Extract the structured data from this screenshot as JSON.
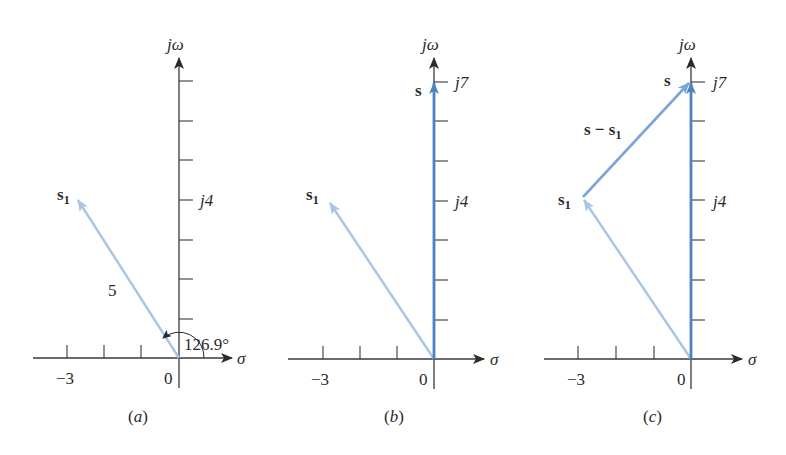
{
  "figure": {
    "panels": [
      {
        "id": "a",
        "caption": "(a)",
        "axis_x_label": "σ",
        "axis_y_label": "jω",
        "tick_label_neg3": "−3",
        "tick_label_origin": "0",
        "tick_label_j4": "j4",
        "vector_s1_label": "s",
        "vector_s1_sub": "1",
        "magnitude_label": "5",
        "angle_label": "126.9°"
      },
      {
        "id": "b",
        "caption": "(b)",
        "axis_x_label": "σ",
        "axis_y_label": "jω",
        "tick_label_neg3": "−3",
        "tick_label_origin": "0",
        "tick_label_j4": "j4",
        "tick_label_j7": "j7",
        "vector_s1_label": "s",
        "vector_s1_sub": "1",
        "vector_s_label": "s"
      },
      {
        "id": "c",
        "caption": "(c)",
        "axis_x_label": "σ",
        "axis_y_label": "jω",
        "tick_label_neg3": "−3",
        "tick_label_origin": "0",
        "tick_label_j4": "j4",
        "tick_label_j7": "j7",
        "vector_s1_label": "s",
        "vector_s1_sub": "1",
        "vector_s_label": "s",
        "vector_diff_label": "s − s",
        "vector_diff_sub": "1"
      }
    ],
    "vectors": {
      "s1": {
        "re": -3,
        "im": 4,
        "magnitude": 5,
        "angle_deg": 126.9
      },
      "s": {
        "re": 0,
        "im": 7
      },
      "s_minus_s1": {
        "re": 3,
        "im": 3
      }
    },
    "colors": {
      "axis": "#3a3a3a",
      "s1_vector": "#a8c5e4",
      "s_vector": "#4a82c4",
      "diff_vector": "#7ba7d8",
      "text": "#2a2a2a"
    }
  }
}
